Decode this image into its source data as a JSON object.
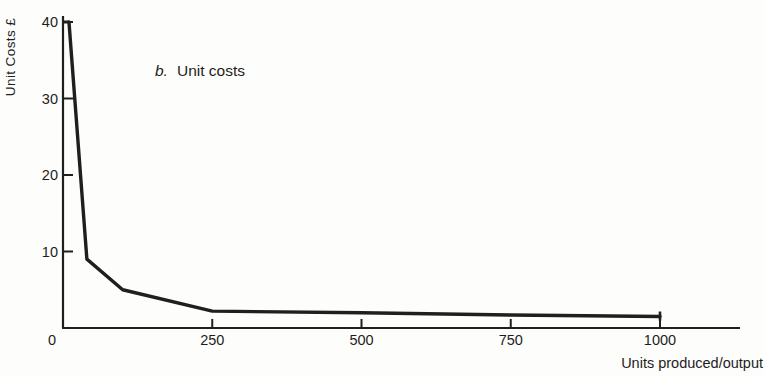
{
  "page": {
    "background": "#fdfdfb",
    "ink_color": "#1f1f1f"
  },
  "chart_data": {
    "type": "line",
    "annotation_letter": "b.",
    "annotation_text": "Unit costs",
    "ylabel": "Unit Costs £",
    "xlabel": "Units produced/output",
    "x": [
      10,
      40,
      100,
      250,
      500,
      750,
      1000
    ],
    "y": [
      40,
      9,
      5,
      2.2,
      2.0,
      1.7,
      1.5
    ],
    "xlim": [
      0,
      1000
    ],
    "ylim": [
      0,
      40
    ],
    "x_ticks": [
      0,
      250,
      500,
      750,
      1000
    ],
    "y_ticks": [
      10,
      20,
      30,
      40
    ],
    "grid": false,
    "legend": "none",
    "end_marker_at_last_point": true,
    "line_color": "#1f1f1f"
  }
}
